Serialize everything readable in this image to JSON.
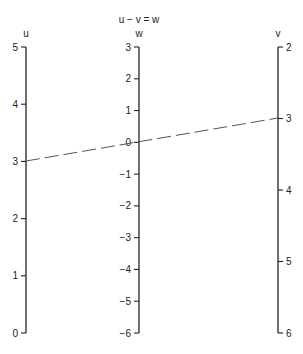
{
  "title": "u − v = w",
  "chart_data": {
    "type": "nomogram",
    "title": "u − v = w",
    "scales": [
      {
        "name": "u",
        "label": "u",
        "x": 26,
        "ticks": [
          5,
          4,
          3,
          2,
          1,
          0
        ],
        "tick_side": "left",
        "range": [
          0,
          5
        ]
      },
      {
        "name": "w",
        "label": "w",
        "x": 139,
        "ticks": [
          3,
          2,
          1,
          0,
          -1,
          -2,
          -3,
          -4,
          -5,
          -6
        ],
        "tick_side": "left",
        "range": [
          -6,
          3
        ]
      },
      {
        "name": "v",
        "label": "v",
        "x": 278,
        "ticks": [
          2,
          3,
          4,
          5,
          6
        ],
        "tick_side": "right",
        "range": [
          2,
          6
        ]
      }
    ],
    "isopleth": {
      "u": 3,
      "v": 3,
      "w": 0,
      "style": "dashed"
    }
  },
  "axes": {
    "u": {
      "label": "u",
      "ticks": [
        "5",
        "4",
        "3",
        "2",
        "1",
        "0"
      ]
    },
    "w": {
      "label": "w",
      "ticks": [
        "3",
        "2",
        "1",
        "0",
        "−1",
        "−2",
        "−3",
        "−4",
        "−5",
        "−6"
      ]
    },
    "v": {
      "label": "v",
      "ticks": [
        "2",
        "3",
        "4",
        "5",
        "6"
      ]
    }
  }
}
